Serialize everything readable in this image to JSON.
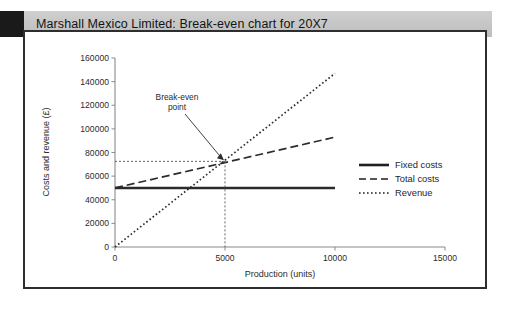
{
  "header": {
    "title": "Marshall Mexico Limited: Break-even chart for 20X7",
    "band_color": "#c6c6c6",
    "square_color": "#1a1a1a"
  },
  "chart_data": {
    "type": "line",
    "title": "Marshall Mexico Limited: Break-even chart for 20X7",
    "xlabel": "Production (units)",
    "ylabel": "Costs and revenue (£)",
    "xlim": [
      0,
      15000
    ],
    "ylim": [
      0,
      160000
    ],
    "xticks": [
      0,
      5000,
      10000,
      15000
    ],
    "xtick_labels": [
      "0",
      "5000",
      "10000",
      "15000"
    ],
    "yticks": [
      0,
      20000,
      40000,
      60000,
      80000,
      100000,
      120000,
      140000,
      160000
    ],
    "ytick_labels": [
      "0",
      "20000",
      "40000",
      "60000",
      "80000",
      "100000",
      "120000",
      "140000",
      "160000"
    ],
    "grid": false,
    "legend_position": "right",
    "series": [
      {
        "name": "Fixed costs",
        "style": "solid",
        "color": "#2b2b2b",
        "width": 2.6,
        "x": [
          0,
          10000
        ],
        "values": [
          50000,
          50000
        ]
      },
      {
        "name": "Total costs",
        "style": "dashed",
        "color": "#2b2b2b",
        "width": 1.7,
        "x": [
          0,
          10000
        ],
        "values": [
          50000,
          93000
        ]
      },
      {
        "name": "Revenue",
        "style": "dotted",
        "color": "#2b2b2b",
        "width": 1.7,
        "x": [
          0,
          10000
        ],
        "values": [
          0,
          147000
        ]
      }
    ],
    "annotations": [
      {
        "label_line1": "Break-even",
        "label_line2": "point",
        "x": 5000,
        "y": 72500,
        "guide_lines": "dotted-x-and-y"
      }
    ]
  },
  "legend": {
    "items": [
      {
        "label": "Fixed costs",
        "style": "solid"
      },
      {
        "label": "Total costs",
        "style": "dashed"
      },
      {
        "label": "Revenue",
        "style": "dotted"
      }
    ]
  }
}
